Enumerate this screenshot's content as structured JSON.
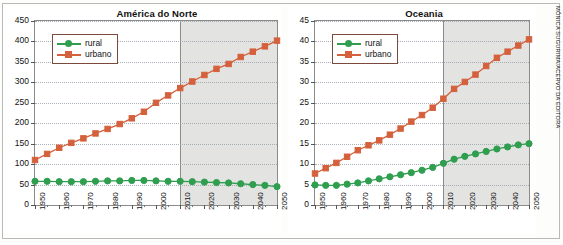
{
  "credit": "MÔNICA SUGURIMA/ACERVO DA EDITORA",
  "legend": {
    "rural_label": "rural",
    "urbano_label": "urbano",
    "rural_color": "#2f9e4f",
    "urbano_color": "#d4603c"
  },
  "charts": [
    {
      "id": "america-do-norte",
      "title": "América do Norte",
      "projection_start": 2010,
      "chart_data": {
        "type": "line",
        "title": "América do Norte",
        "xlabel": "",
        "ylabel": "",
        "xlim": [
          1950,
          2050
        ],
        "ylim": [
          0,
          450
        ],
        "yticks": [
          0,
          50,
          100,
          150,
          200,
          250,
          300,
          350,
          400,
          450
        ],
        "xticks": [
          1950,
          1960,
          1970,
          1980,
          1990,
          2000,
          2010,
          2020,
          2030,
          2040,
          2050
        ],
        "x": [
          1950,
          1955,
          1960,
          1965,
          1970,
          1975,
          1980,
          1985,
          1990,
          1995,
          2000,
          2005,
          2010,
          2015,
          2020,
          2025,
          2030,
          2035,
          2040,
          2045,
          2050
        ],
        "grid": true,
        "legend_position": "upper-left",
        "series": [
          {
            "name": "rural",
            "color": "#2f9e4f",
            "marker": "circle",
            "values": [
              58,
              58,
              57,
              57,
              57,
              58,
              59,
              59,
              60,
              60,
              59,
              58,
              58,
              57,
              56,
              55,
              54,
              52,
              50,
              48,
              45
            ]
          },
          {
            "name": "urbano",
            "color": "#d4603c",
            "marker": "square",
            "values": [
              110,
              125,
              140,
              152,
              163,
              175,
              186,
              198,
              212,
              228,
              250,
              268,
              286,
              302,
              318,
              333,
              345,
              362,
              375,
              388,
              402
            ]
          }
        ]
      }
    },
    {
      "id": "oceania",
      "title": "Oceania",
      "projection_start": 2010,
      "chart_data": {
        "type": "line",
        "title": "Oceania",
        "xlabel": "",
        "ylabel": "",
        "xlim": [
          1950,
          2050
        ],
        "ylim": [
          0,
          45
        ],
        "yticks": [
          0,
          5,
          10,
          15,
          20,
          25,
          30,
          35,
          40,
          45
        ],
        "xticks": [
          1950,
          1960,
          1970,
          1980,
          1990,
          2000,
          2010,
          2020,
          2030,
          2040,
          2050
        ],
        "x": [
          1950,
          1955,
          1960,
          1965,
          1970,
          1975,
          1980,
          1985,
          1990,
          1995,
          2000,
          2005,
          2010,
          2015,
          2020,
          2025,
          2030,
          2035,
          2040,
          2045,
          2050
        ],
        "grid": true,
        "legend_position": "upper-left",
        "series": [
          {
            "name": "rural",
            "color": "#2f9e4f",
            "marker": "circle",
            "values": [
              4.9,
              4.8,
              4.8,
              5.1,
              5.4,
              5.9,
              6.4,
              6.9,
              7.4,
              7.9,
              8.5,
              9.2,
              10.2,
              11.2,
              11.9,
              12.5,
              13.1,
              13.7,
              14.2,
              14.7,
              15.0
            ]
          },
          {
            "name": "urbano",
            "color": "#d4603c",
            "marker": "square",
            "values": [
              7.7,
              9.0,
              10.3,
              11.8,
              13.4,
              14.6,
              15.8,
              17.2,
              18.7,
              20.4,
              22.0,
              23.8,
              26.0,
              28.4,
              30.1,
              31.9,
              34.0,
              36.0,
              37.5,
              39.0,
              40.5
            ]
          }
        ]
      }
    }
  ]
}
